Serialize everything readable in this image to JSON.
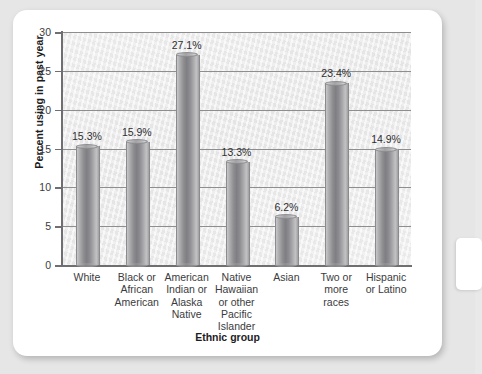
{
  "chart_data": {
    "type": "bar",
    "title": "",
    "xlabel": "Ethnic group",
    "ylabel": "Percent using in past year",
    "categories": [
      "White",
      "Black or African American",
      "American Indian or Alaska Native",
      "Native Hawaiian or other Pacific Islander",
      "Asian",
      "Two or more races",
      "Hispanic or Latino"
    ],
    "category_lines": [
      [
        "White"
      ],
      [
        "Black or",
        "African",
        "American"
      ],
      [
        "American",
        "Indian or",
        "Alaska",
        "Native"
      ],
      [
        "Native",
        "Hawaiian",
        "or other",
        "Pacific",
        "Islander"
      ],
      [
        "Asian"
      ],
      [
        "Two or",
        "more",
        "races"
      ],
      [
        "Hispanic",
        "or Latino"
      ]
    ],
    "values": [
      15.3,
      15.9,
      27.1,
      13.3,
      6.2,
      23.4,
      14.9
    ],
    "value_labels": [
      "15.3%",
      "15.9%",
      "27.1%",
      "13.3%",
      "6.2%",
      "23.4%",
      "14.9%"
    ],
    "ylim": [
      0,
      30
    ],
    "yticks": [
      0,
      5,
      10,
      15,
      20,
      25,
      30
    ],
    "ytick_labels": [
      "0",
      "5",
      "10",
      "15",
      "20",
      "25",
      "30"
    ],
    "grid": true,
    "legend": "none",
    "bar_style": "3d-cylinder",
    "colors": {
      "bar_light": "#c7c7c9",
      "bar_dark": "#7f7f83",
      "gridline": "#8e8e90",
      "axis": "#6f6f72",
      "plot_background": "#ececed",
      "card_background": "#ffffff",
      "page_background": "#e6e6e6",
      "text": "#3b3b3d"
    }
  }
}
